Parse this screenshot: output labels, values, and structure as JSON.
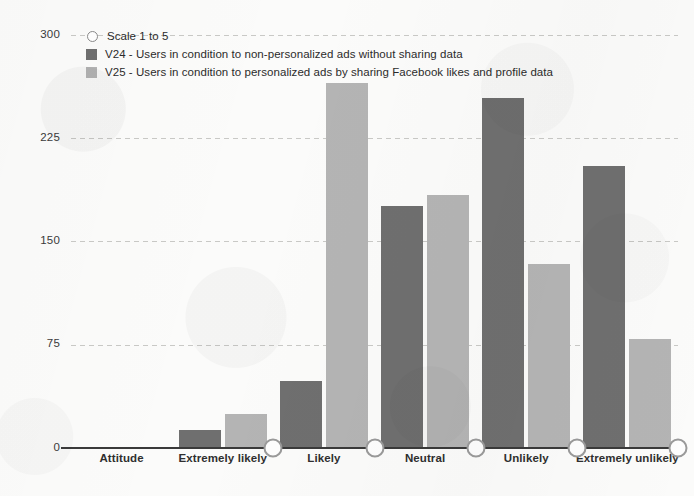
{
  "chart_data": {
    "type": "bar",
    "title": "",
    "xlabel": "",
    "ylabel": "",
    "ylim": [
      0,
      300
    ],
    "yticks": [
      0,
      75,
      150,
      225,
      300
    ],
    "grid": true,
    "legend_position": "top-left",
    "categories": [
      "Attitude",
      "Extremely likely",
      "Likely",
      "Neutral",
      "Unlikely",
      "Extremely unlikely"
    ],
    "series": [
      {
        "name": "V24 - Users in condition to non-personalized ads without sharing data",
        "short_name": "V24",
        "color": "#6f6f6f",
        "values": [
          0,
          13,
          49,
          176,
          254,
          205
        ]
      },
      {
        "name": "V25 - Users in condition to personalized ads by sharing Facebook likes and profile data",
        "short_name": "V25",
        "color": "#b4b4b4",
        "values": [
          0,
          25,
          265,
          184,
          134,
          79
        ]
      }
    ],
    "markers": {
      "name": "Scale 1 to 5",
      "color": "#ffffff",
      "edge_color": "#8a8a8a",
      "shape": "circle",
      "at_categories": [
        "Extremely likely",
        "Likely",
        "Neutral",
        "Unlikely",
        "Extremely unlikely"
      ],
      "value": 0
    }
  },
  "legend": {
    "items": [
      {
        "marker": "circle-outline",
        "label": "Scale 1 to 5"
      },
      {
        "marker": "square-dark",
        "label": "V24 - Users in condition to non-personalized ads without sharing data"
      },
      {
        "marker": "square-light",
        "label": "V25 - Users in condition to personalized ads by sharing Facebook likes and profile data"
      }
    ]
  },
  "axis": {
    "y_tick_labels": [
      "300",
      "225",
      "150",
      "75",
      "0"
    ],
    "x_tick_labels": [
      "Attitude",
      "Extremely likely",
      "Likely",
      "Neutral",
      "Unlikely",
      "Extremely unlikely"
    ]
  }
}
